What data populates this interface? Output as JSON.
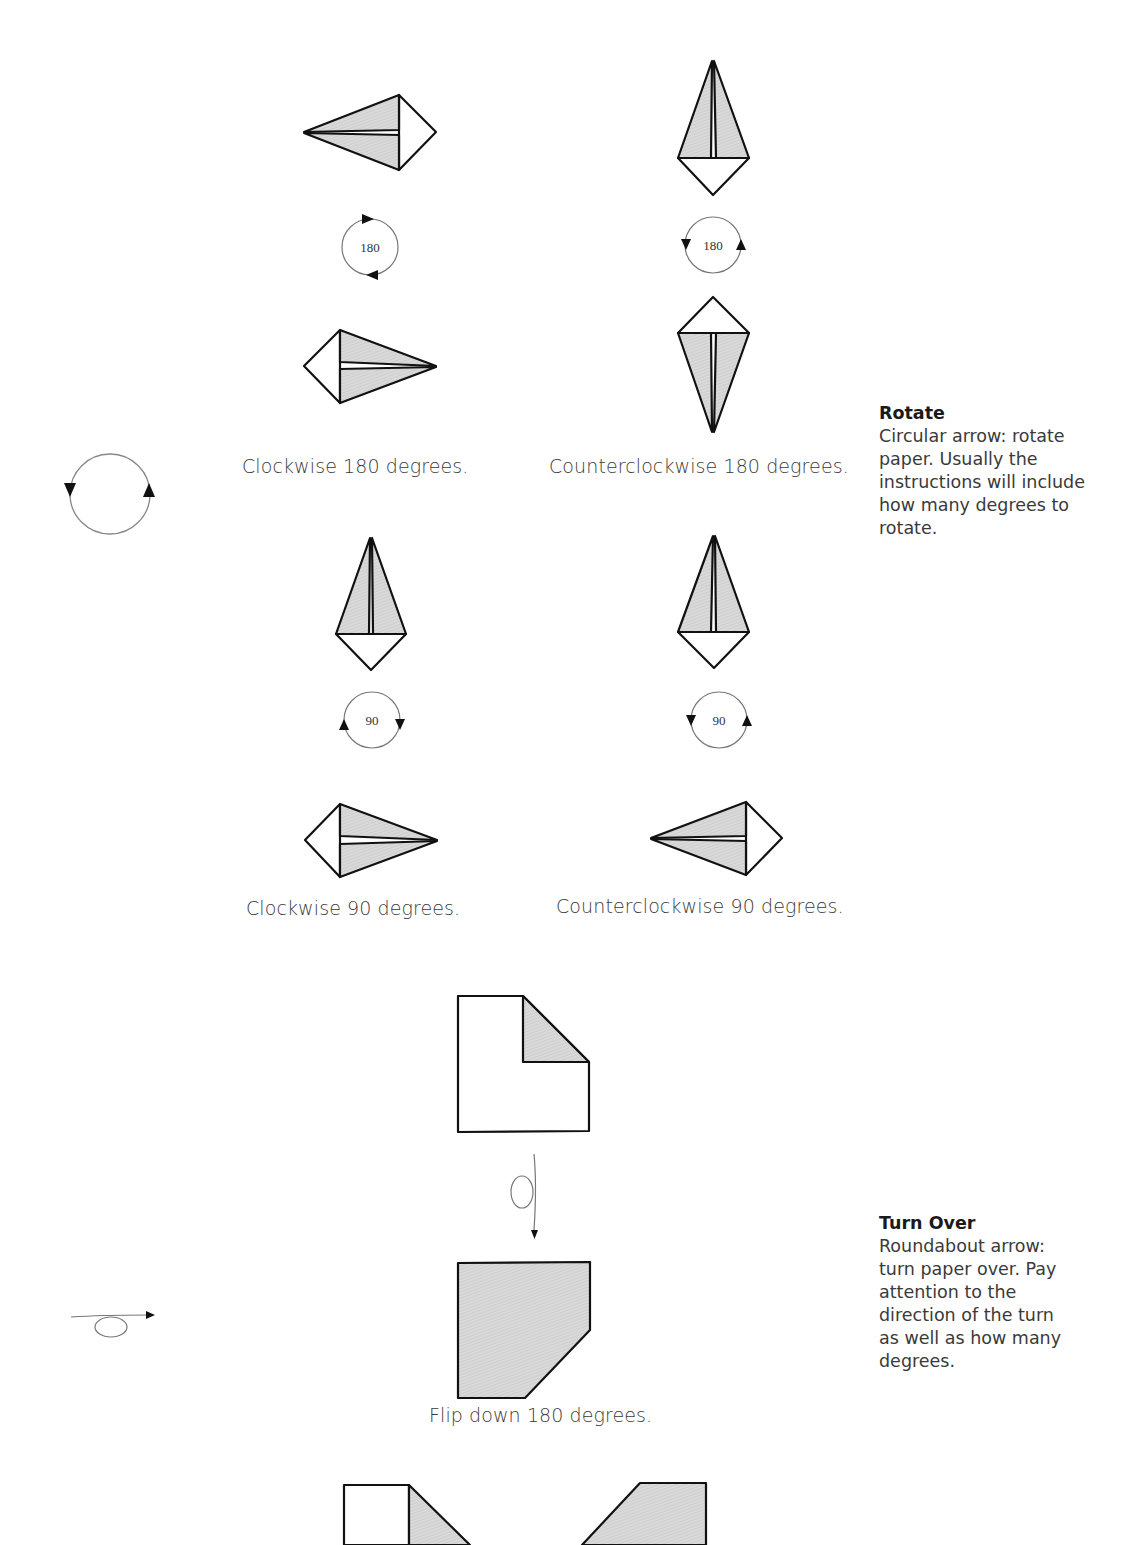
{
  "rotate_section": {
    "heading": "Rotate",
    "description_lines": [
      "Circular arrow: rotate",
      "paper.  Usually the",
      "instructions will include",
      "how many degrees to",
      "rotate."
    ],
    "examples": [
      {
        "caption": "Clockwise 180 degrees.",
        "degrees": "180",
        "direction": "clockwise"
      },
      {
        "caption": "Counterclockwise 180 degrees.",
        "degrees": "180",
        "direction": "counterclockwise"
      },
      {
        "caption": "Clockwise 90 degrees.",
        "degrees": "90",
        "direction": "clockwise"
      },
      {
        "caption": "Counterclockwise 90 degrees.",
        "degrees": "90",
        "direction": "counterclockwise"
      }
    ],
    "symbol": "circular-arrow"
  },
  "turn_over_section": {
    "heading": "Turn Over",
    "description_lines": [
      "Roundabout arrow:",
      "turn paper over.  Pay",
      "attention to the",
      "direction of the turn",
      "as well as how many",
      "degrees."
    ],
    "examples": [
      {
        "caption": "Flip down 180 degrees."
      }
    ],
    "symbol": "roundabout-arrow"
  },
  "colors": {
    "paper_colored": "#d6d6d6",
    "paper_white": "#ffffff",
    "line": "#111111",
    "arrow_line": "#777777"
  }
}
